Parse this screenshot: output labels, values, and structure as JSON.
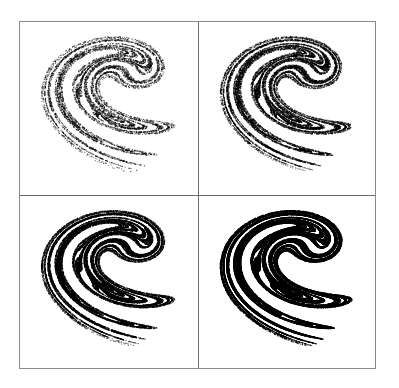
{
  "figure": {
    "layout": "2x2 grid",
    "border_color": "#8a8a8a",
    "divider_color": "#6a6a6a",
    "background": "#ffffff",
    "ink_color": "#000000",
    "panels": [
      {
        "id": "top-left",
        "description": "Ikeda-type strange attractor, sparse point density",
        "iterations": 9000,
        "dot_size": 1,
        "alpha": 0.55
      },
      {
        "id": "top-right",
        "description": "Ikeda-type strange attractor, medium point density",
        "iterations": 18000,
        "dot_size": 1,
        "alpha": 0.6
      },
      {
        "id": "bottom-left",
        "description": "Ikeda-type strange attractor, high point density",
        "iterations": 36000,
        "dot_size": 1,
        "alpha": 0.6
      },
      {
        "id": "bottom-right",
        "description": "Ikeda-type strange attractor, very high point density",
        "iterations": 90000,
        "dot_size": 1,
        "alpha": 0.7
      }
    ]
  },
  "attractor": {
    "map": "ikeda",
    "u": 0.9,
    "x_range": [
      -0.55,
      1.95
    ],
    "y_range": [
      -2.55,
      1.0
    ]
  }
}
